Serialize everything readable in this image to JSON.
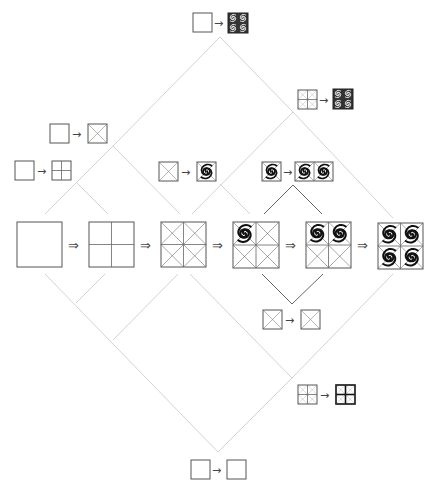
{
  "diagram": {
    "title": "",
    "symbols": {
      "derivation_arrow": "⇒",
      "rule_arrow": "→"
    },
    "colors": {
      "connector": "#c8c8c8",
      "connector_dark": "#555555",
      "stroke": "#555555",
      "spiral": "#111111",
      "dark_fill": "#333333"
    },
    "main_sequence": [
      {
        "id": "s1",
        "kind": "empty"
      },
      {
        "id": "s2",
        "kind": "quartered"
      },
      {
        "id": "s3",
        "kind": "quartered-crossed"
      },
      {
        "id": "s4",
        "kind": "one-spiral"
      },
      {
        "id": "s5",
        "kind": "two-spirals"
      },
      {
        "id": "s6",
        "kind": "four-spirals"
      }
    ],
    "rules": [
      {
        "id": "r-top",
        "lhs": "empty",
        "rhs": "filled-spiral-block"
      },
      {
        "id": "r-upper-right",
        "lhs": "quartered-crossed-small",
        "rhs": "filled-spiral-block"
      },
      {
        "id": "r-left-1",
        "lhs": "empty",
        "rhs": "crossed"
      },
      {
        "id": "r-left-2",
        "lhs": "empty",
        "rhs": "quartered"
      },
      {
        "id": "r-mid-1",
        "lhs": "crossed",
        "rhs": "spiral"
      },
      {
        "id": "r-mid-2",
        "lhs": "spiral",
        "rhs": "double-spiral"
      },
      {
        "id": "r-lower-1",
        "lhs": "crossed",
        "rhs": "crossed"
      },
      {
        "id": "r-lower-2",
        "lhs": "quartered-crossed-small",
        "rhs": "quartered-crossed-bold"
      },
      {
        "id": "r-bottom",
        "lhs": "empty",
        "rhs": "empty"
      }
    ]
  }
}
